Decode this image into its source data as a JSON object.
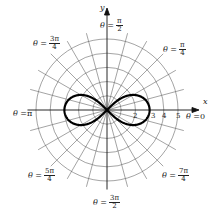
{
  "figure": {
    "type": "polar-graph",
    "curve": "lemniscate",
    "equation": "r^2 = 9cos(2θ)",
    "axes": {
      "x_label": "x",
      "y_label": "y"
    },
    "radial_ticks": [
      "2",
      "3",
      "4",
      "5"
    ],
    "angle_labels": [
      {
        "id": "a0",
        "prefix": "θ = ",
        "value": "0"
      },
      {
        "id": "a1",
        "prefix": "θ = ",
        "num": "π",
        "den": "4"
      },
      {
        "id": "a2",
        "prefix": "θ = ",
        "num": "π",
        "den": "2"
      },
      {
        "id": "a3",
        "prefix": "θ = ",
        "num": "3π",
        "den": "4"
      },
      {
        "id": "a4",
        "prefix": "θ = ",
        "value": "π"
      },
      {
        "id": "a5",
        "prefix": "θ = ",
        "num": "5π",
        "den": "4"
      },
      {
        "id": "a6",
        "prefix": "θ = ",
        "num": "3π",
        "den": "2"
      },
      {
        "id": "a7",
        "prefix": "θ = ",
        "num": "7π",
        "den": "4"
      }
    ],
    "colors": {
      "grid": "#555555",
      "curve": "#000000",
      "text": "#222222"
    }
  }
}
